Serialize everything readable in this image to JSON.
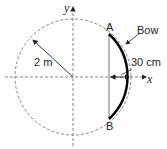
{
  "diagram": {
    "axes": {
      "x_label": "x",
      "y_label": "y"
    },
    "circle": {
      "radius_label": "2 m",
      "style": "dashed"
    },
    "points": {
      "top": "A",
      "bottom": "B"
    },
    "bow": {
      "label": "Bow",
      "sagitta_label": "30 cm"
    },
    "colors": {
      "line": "#222222",
      "dashed": "#777777",
      "bow": "#000000"
    }
  }
}
